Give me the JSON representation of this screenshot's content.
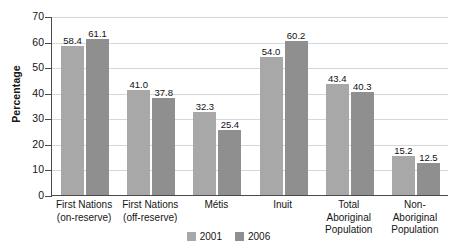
{
  "chart_data": {
    "type": "bar",
    "title": "",
    "xlabel": "",
    "ylabel": "Percentage",
    "ylim": [
      0,
      70
    ],
    "ytick_step": 10,
    "yticks": [
      70,
      60,
      50,
      40,
      30,
      20,
      10,
      0
    ],
    "grid": true,
    "legend_position": "bottom",
    "categories": [
      "First Nations\n(on-reserve)",
      "First Nations\n(off-reserve)",
      "Métis",
      "Inuit",
      "Total\nAboriginal\nPopulation",
      "Non-\nAboriginal\nPopulation"
    ],
    "series": [
      {
        "name": "2001",
        "color": "#a8a8a8",
        "values": [
          58.4,
          41.0,
          32.3,
          54.0,
          43.4,
          15.2
        ]
      },
      {
        "name": "2006",
        "color": "#8f8f8f",
        "values": [
          61.1,
          37.8,
          25.4,
          60.2,
          40.3,
          12.5
        ]
      }
    ],
    "value_labels": [
      [
        "58.4",
        "41.0",
        "32.3",
        "54.0",
        "43.4",
        "15.2"
      ],
      [
        "61.1",
        "37.8",
        "25.4",
        "60.2",
        "40.3",
        "12.5"
      ]
    ]
  },
  "legend": {
    "items": [
      {
        "label": "2001",
        "color": "#a8a8a8"
      },
      {
        "label": "2006",
        "color": "#8f8f8f"
      }
    ]
  }
}
